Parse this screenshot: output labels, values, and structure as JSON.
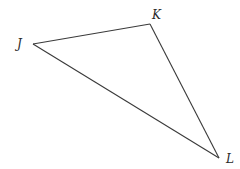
{
  "diagram": {
    "type": "triangle",
    "name": "JKL",
    "stroke_color": "#3a3a3a",
    "background": "#ffffff",
    "vertices": [
      {
        "id": "J",
        "label": "J",
        "x": 33,
        "y": 44,
        "label_x": 17,
        "label_y": 48
      },
      {
        "id": "K",
        "label": "K",
        "x": 150,
        "y": 24,
        "label_x": 152,
        "label_y": 19
      },
      {
        "id": "L",
        "label": "L",
        "x": 219,
        "y": 158,
        "label_x": 226,
        "label_y": 163
      }
    ],
    "edges": [
      {
        "from": "J",
        "to": "K"
      },
      {
        "from": "K",
        "to": "L"
      },
      {
        "from": "L",
        "to": "J"
      }
    ]
  }
}
